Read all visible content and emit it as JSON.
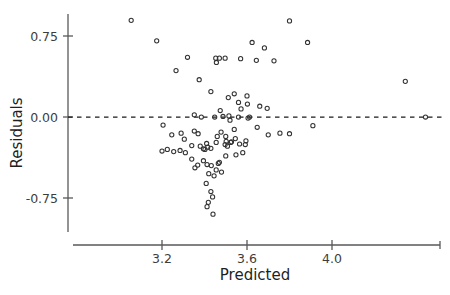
{
  "chart_data": {
    "type": "scatter",
    "title": "",
    "subtitle": "",
    "xlabel": "Predicted",
    "ylabel": "Residuals",
    "xlim": [
      3.02,
      4.49
    ],
    "ylim": [
      -1.02,
      0.97
    ],
    "grid": false,
    "legend": null,
    "annotations": [
      {
        "kind": "hline",
        "y": 0.0,
        "style": "dashed",
        "label": "zero-residual-reference-line"
      }
    ],
    "xticks": [
      3.2,
      3.6,
      4.0
    ],
    "xticklabels": [
      "3.2",
      "3.6",
      "4.0"
    ],
    "yticks": [
      0.75,
      0.0,
      -0.75
    ],
    "yticklabels": [
      "0.75",
      "0.00",
      "-0.75"
    ],
    "marker": "open-circle",
    "marker_color": "#333333",
    "point_count": 94,
    "points": [
      [
        3.055,
        0.895
      ],
      [
        3.175,
        0.705
      ],
      [
        3.32,
        0.553
      ],
      [
        3.266,
        0.43
      ],
      [
        3.453,
        0.545
      ],
      [
        3.456,
        0.505
      ],
      [
        3.47,
        0.545
      ],
      [
        3.497,
        0.545
      ],
      [
        3.375,
        0.345
      ],
      [
        3.57,
        0.54
      ],
      [
        3.43,
        0.235
      ],
      [
        3.624,
        0.69
      ],
      [
        3.682,
        0.64
      ],
      [
        3.644,
        0.525
      ],
      [
        3.727,
        0.52
      ],
      [
        3.6,
        0.195
      ],
      [
        3.8,
        0.89
      ],
      [
        3.885,
        0.69
      ],
      [
        4.345,
        0.33
      ],
      [
        3.352,
        0.02
      ],
      [
        3.205,
        -0.075
      ],
      [
        3.52,
        -0.03
      ],
      [
        3.478,
        -0.14
      ],
      [
        3.54,
        -0.115
      ],
      [
        3.5,
        -0.18
      ],
      [
        3.455,
        -0.235
      ],
      [
        3.305,
        -0.205
      ],
      [
        3.34,
        -0.265
      ],
      [
        3.38,
        -0.27
      ],
      [
        3.41,
        -0.245
      ],
      [
        3.415,
        -0.28
      ],
      [
        3.43,
        -0.29
      ],
      [
        3.395,
        -0.295
      ],
      [
        3.402,
        -0.3
      ],
      [
        3.285,
        -0.31
      ],
      [
        3.31,
        -0.33
      ],
      [
        3.255,
        -0.32
      ],
      [
        3.225,
        -0.3
      ],
      [
        3.2,
        -0.315
      ],
      [
        3.47,
        -0.42
      ],
      [
        3.432,
        -0.45
      ],
      [
        3.455,
        -0.49
      ],
      [
        3.42,
        -0.525
      ],
      [
        3.445,
        -0.545
      ],
      [
        3.48,
        -0.51
      ],
      [
        3.408,
        -0.615
      ],
      [
        3.43,
        -0.69
      ],
      [
        3.438,
        -0.74
      ],
      [
        3.418,
        -0.79
      ],
      [
        3.412,
        -0.83
      ],
      [
        3.44,
        -0.9
      ],
      [
        3.465,
        -0.43
      ],
      [
        3.502,
        -0.225
      ],
      [
        3.523,
        -0.235
      ],
      [
        3.545,
        -0.2
      ],
      [
        3.565,
        -0.25
      ],
      [
        3.595,
        -0.22
      ],
      [
        3.58,
        -0.33
      ],
      [
        3.612,
        0.0
      ],
      [
        3.648,
        -0.095
      ],
      [
        3.7,
        -0.165
      ],
      [
        3.755,
        -0.15
      ],
      [
        3.8,
        -0.155
      ],
      [
        3.695,
        0.08
      ],
      [
        3.66,
        0.1
      ],
      [
        3.602,
        0.12
      ],
      [
        3.56,
        0.135
      ],
      [
        3.512,
        0.18
      ],
      [
        3.54,
        0.215
      ],
      [
        3.572,
        0.075
      ],
      [
        3.474,
        0.06
      ],
      [
        3.448,
        0.0
      ],
      [
        3.487,
        0.005
      ],
      [
        3.515,
        0.01
      ],
      [
        3.56,
        0.0
      ],
      [
        3.605,
        -0.01
      ],
      [
        3.385,
        0.0
      ],
      [
        3.352,
        -0.13
      ],
      [
        3.37,
        -0.155
      ],
      [
        3.29,
        -0.15
      ],
      [
        3.246,
        -0.165
      ],
      [
        3.46,
        -0.18
      ],
      [
        3.497,
        -0.255
      ],
      [
        3.508,
        -0.27
      ],
      [
        3.527,
        -0.23
      ],
      [
        3.592,
        -0.255
      ],
      [
        3.548,
        -0.35
      ],
      [
        3.5,
        -0.36
      ],
      [
        3.34,
        -0.39
      ],
      [
        3.395,
        -0.405
      ],
      [
        3.368,
        -0.445
      ],
      [
        3.412,
        -0.44
      ],
      [
        3.355,
        -0.47
      ],
      [
        3.91,
        -0.08
      ],
      [
        4.44,
        0.0
      ]
    ]
  },
  "axes": {
    "x_axis_name": "predicted-axis",
    "y_axis_name": "residuals-axis"
  }
}
